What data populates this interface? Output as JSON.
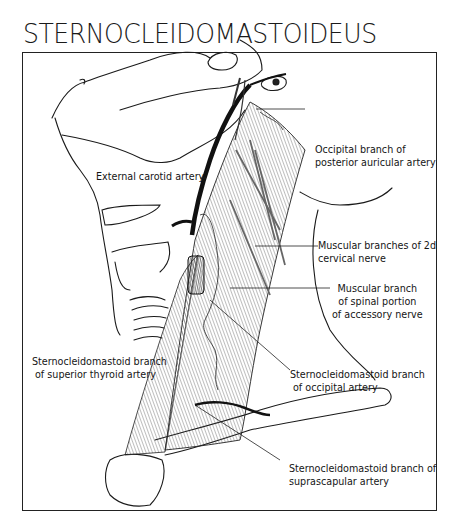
{
  "title": "STERNOCLEIDOMASTOIDEUS",
  "labels": {
    "occipital_branch_posterior_auricular": [
      "Occipital branch of",
      "posterior auricular artery"
    ],
    "external_carotid": [
      "External carotid artery"
    ],
    "muscular_branches_2d_cervical": [
      "Muscular branches of 2d",
      "cervical nerve"
    ],
    "muscular_branch_spinal_accessory": [
      "Muscular branch",
      "of spinal portion",
      "of accessory nerve"
    ],
    "scm_branch_superior_thyroid": [
      "Sternocleidomastoid branch",
      "of superior thyroid artery"
    ],
    "scm_branch_occipital": [
      "Sternocleidomastoid branch",
      "of occipital artery"
    ],
    "scm_branch_suprascapular": [
      "Sternocleidomastoid branch of",
      "suprascapular artery"
    ]
  },
  "colors": {
    "ink": "#151515",
    "background": "#ffffff",
    "muscle_hatch": "#555555"
  }
}
